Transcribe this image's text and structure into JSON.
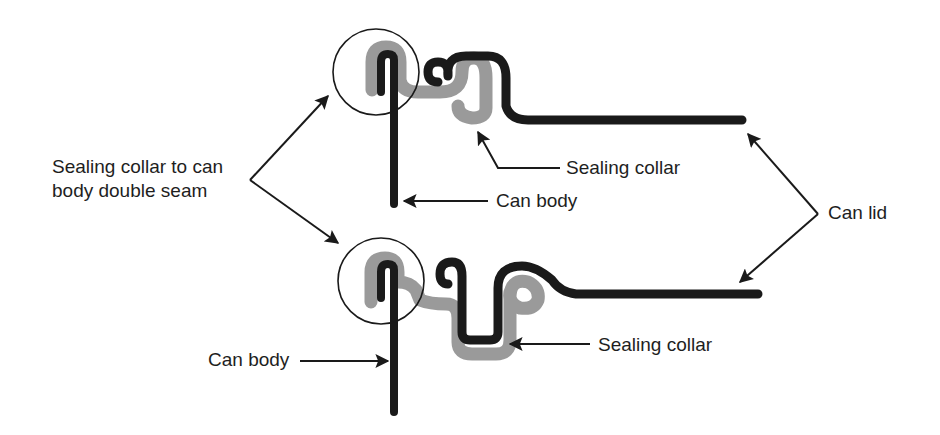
{
  "diagram": {
    "colors": {
      "metal": "#1a1a1a",
      "collar": "#9a9a9a",
      "circle": "#1a1a1a",
      "arrow": "#1a1a1a",
      "text": "#1e1e1e"
    },
    "labels": {
      "seam_line1": "Sealing collar to can",
      "seam_line2": "body double seam",
      "top_collar": "Sealing collar",
      "top_body": "Can body",
      "lid": "Can lid",
      "bottom_body": "Can body",
      "bottom_collar": "Sealing collar"
    }
  }
}
